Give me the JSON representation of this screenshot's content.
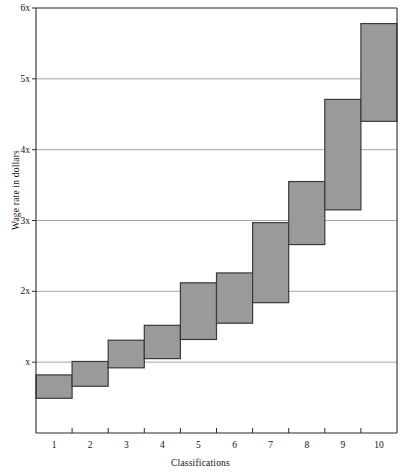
{
  "chart_data": {
    "type": "bar",
    "subtype": "floating-range-bar",
    "title": "",
    "xlabel": "Classifications",
    "ylabel": "Wage rate in dollars",
    "categories": [
      "1",
      "2",
      "3",
      "4",
      "5",
      "6",
      "7",
      "8",
      "9",
      "10"
    ],
    "ytick_labels": [
      "x",
      "2x",
      "3x",
      "4x",
      "5x",
      "6x"
    ],
    "ytick_values": [
      1,
      2,
      3,
      4,
      5,
      6
    ],
    "ylim": [
      0,
      6
    ],
    "xlim": [
      0.5,
      10.5
    ],
    "grid": "horizontal",
    "legend": "none",
    "series": [
      {
        "name": "Wage range",
        "low": [
          0.49,
          0.66,
          0.92,
          1.05,
          1.32,
          1.55,
          1.84,
          2.66,
          3.15,
          4.4
        ],
        "high": [
          0.82,
          1.01,
          1.31,
          1.52,
          2.12,
          2.26,
          2.97,
          3.55,
          4.71,
          5.78
        ]
      }
    ],
    "bar_fill": "#9a9a9a",
    "bar_stroke": "#3a3a3a",
    "grid_color": "#808080",
    "axis_color": "#2a2a2a",
    "background": "#ffffff"
  }
}
